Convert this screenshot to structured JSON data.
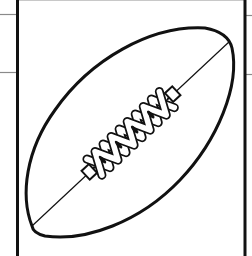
{
  "image": {
    "subject": "american-football-line-drawing",
    "style": "black outline coloring page",
    "colors": {
      "background": "#ffffff",
      "ink": "#111111",
      "guide_lines": "#8a8a8a"
    }
  },
  "frame": {
    "left_border_x": 17,
    "right_border_x": 245
  },
  "football": {
    "laces_count": 5,
    "end_caps": 2
  }
}
